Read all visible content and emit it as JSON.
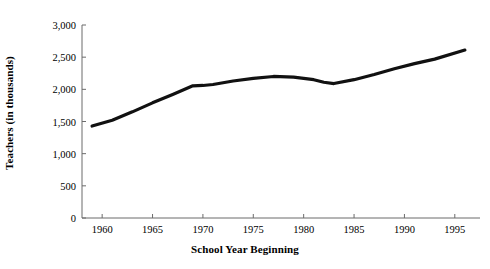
{
  "chart_data": {
    "type": "line",
    "title": "",
    "xlabel": "School Year Beginning",
    "ylabel": "Teachers (in thousands)",
    "xlim": [
      1958,
      1997.5
    ],
    "ylim": [
      0,
      3000
    ],
    "grid": false,
    "legend": "none",
    "line_color": "#111111",
    "axis_color": "#6b6b6b",
    "xticks": [
      1960,
      1965,
      1970,
      1975,
      1980,
      1985,
      1990,
      1995
    ],
    "xtick_labels": [
      "1960",
      "1965",
      "1970",
      "1975",
      "1980",
      "1985",
      "1990",
      "1995"
    ],
    "yticks": [
      0,
      500,
      1000,
      1500,
      2000,
      2500,
      3000
    ],
    "ytick_labels": [
      "0",
      "500",
      "1,000",
      "1,500",
      "2,000",
      "2,500",
      "3,000"
    ],
    "series": [
      {
        "name": "Teachers",
        "x": [
          1959,
          1961,
          1963,
          1965,
          1967,
          1969,
          1970,
          1971,
          1973,
          1975,
          1977,
          1979,
          1981,
          1982,
          1983,
          1985,
          1987,
          1989,
          1991,
          1993,
          1996
        ],
        "values": [
          1430,
          1520,
          1650,
          1790,
          1920,
          2055,
          2060,
          2075,
          2130,
          2170,
          2200,
          2190,
          2150,
          2110,
          2090,
          2150,
          2230,
          2320,
          2400,
          2470,
          2610
        ]
      }
    ]
  }
}
